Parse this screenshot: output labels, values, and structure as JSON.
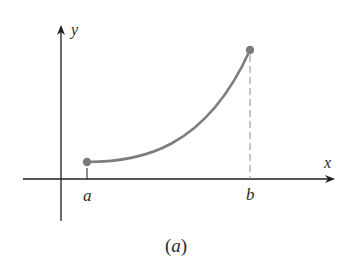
{
  "figure": {
    "caption": "(a)",
    "caption_var": "a",
    "axis_x_label": "x",
    "axis_y_label": "y",
    "point_a_label": "a",
    "point_b_label": "b"
  },
  "colors": {
    "axis": "#1e1e1e",
    "curve": "#7d7d7d",
    "endpoint": "#7a7a7a",
    "dashed": "#8a8a8a"
  },
  "curve": {
    "description": "increasing, concave-up curve from endpoint at a to endpoint at b, with dashed vertical line from b down to x-axis",
    "start": "a",
    "end": "b"
  }
}
